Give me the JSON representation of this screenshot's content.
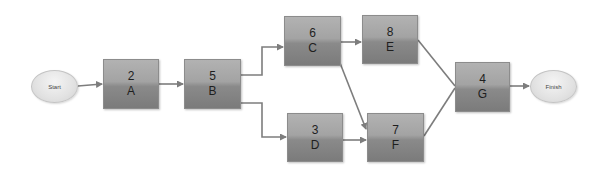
{
  "diagram": {
    "type": "activity-on-node network",
    "start_label": "Start",
    "finish_label": "Finish",
    "nodes": [
      {
        "id": "A",
        "duration": "2",
        "label": "A"
      },
      {
        "id": "B",
        "duration": "5",
        "label": "B"
      },
      {
        "id": "C",
        "duration": "6",
        "label": "C"
      },
      {
        "id": "D",
        "duration": "3",
        "label": "D"
      },
      {
        "id": "E",
        "duration": "8",
        "label": "E"
      },
      {
        "id": "F",
        "duration": "7",
        "label": "F"
      },
      {
        "id": "G",
        "duration": "4",
        "label": "G"
      }
    ],
    "edges": [
      {
        "from": "Start",
        "to": "A"
      },
      {
        "from": "A",
        "to": "B"
      },
      {
        "from": "B",
        "to": "C"
      },
      {
        "from": "B",
        "to": "D"
      },
      {
        "from": "C",
        "to": "E"
      },
      {
        "from": "C",
        "to": "F"
      },
      {
        "from": "D",
        "to": "F"
      },
      {
        "from": "E",
        "to": "G"
      },
      {
        "from": "F",
        "to": "G"
      },
      {
        "from": "G",
        "to": "Finish"
      }
    ],
    "colors": {
      "node_top": "#b2b2b2",
      "node_bottom": "#7b7b7b",
      "terminal_fill": "#e2e2e2",
      "edge": "#7d7d7d",
      "text": "#1e1e1e"
    }
  }
}
